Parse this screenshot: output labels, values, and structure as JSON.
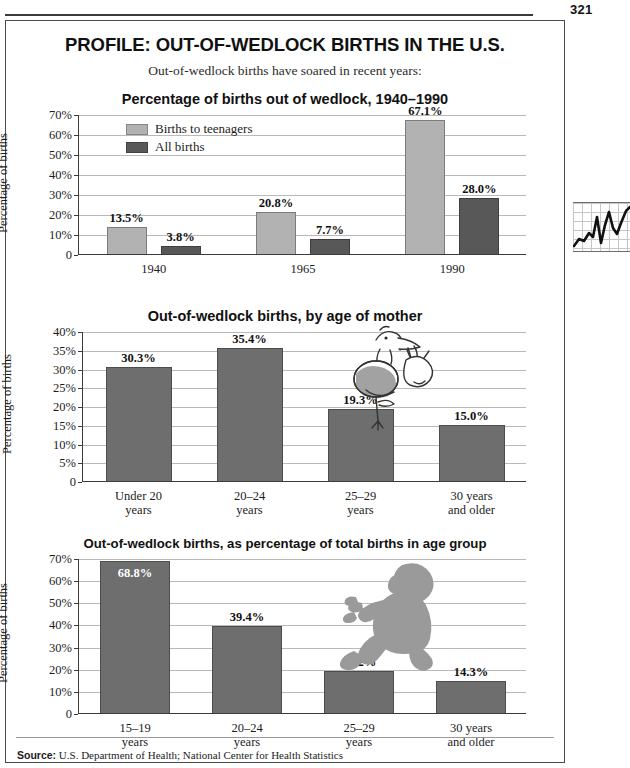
{
  "folio": "321",
  "header": {
    "title": "PROFILE: OUT-OF-WEDLOCK BIRTHS IN THE U.S.",
    "subtitle": "Out-of-wedlock births have soared in recent years:"
  },
  "colors": {
    "bar_light": "#b2b2b2",
    "bar_dark": "#585858",
    "bar_mid": "#6e6e6e",
    "axis": "#3c3c3c",
    "grid": "#b9b9b9"
  },
  "source": {
    "label": "Source:",
    "text": "U.S. Department of Health; National Center for Health Statistics"
  },
  "margin_art": {
    "name": "line-chart-doodle"
  },
  "illustrations": [
    {
      "name": "stork-carrying-bundle-illustration",
      "chart": 2
    },
    {
      "name": "crawling-baby-silhouette-illustration",
      "chart": 3
    }
  ],
  "chart_data": [
    {
      "type": "bar",
      "title": "Percentage of births out of wedlock, 1940–1990",
      "ylabel": "Percentage of births",
      "xlabel": "",
      "categories": [
        "1940",
        "1965",
        "1990"
      ],
      "ylim": [
        0,
        70
      ],
      "yticks": [
        "0",
        "10%",
        "20%",
        "30%",
        "40%",
        "50%",
        "60%",
        "70%"
      ],
      "ytick_values": [
        0,
        10,
        20,
        30,
        40,
        50,
        60,
        70
      ],
      "grid": true,
      "legend_position": "inside-top-left",
      "series": [
        {
          "name": "Births to teenagers",
          "color": "#b2b2b2",
          "values": [
            13.5,
            20.8,
            67.1
          ],
          "labels": [
            "13.5%",
            "20.8%",
            "67.1%"
          ]
        },
        {
          "name": "All births",
          "color": "#585858",
          "values": [
            3.8,
            7.7,
            28.0
          ],
          "labels": [
            "3.8%",
            "7.7%",
            "28.0%"
          ]
        }
      ]
    },
    {
      "type": "bar",
      "title": "Out-of-wedlock births, by age of mother",
      "ylabel": "Percentage of births",
      "xlabel": "",
      "categories": [
        "Under 20\nyears",
        "20–24\nyears",
        "25–29\nyears",
        "30 years\nand older"
      ],
      "ylim": [
        0,
        40
      ],
      "yticks": [
        "0",
        "5%",
        "10%",
        "15%",
        "20%",
        "25%",
        "30%",
        "35%",
        "40%"
      ],
      "ytick_values": [
        0,
        5,
        10,
        15,
        20,
        25,
        30,
        35,
        40
      ],
      "grid": true,
      "series": [
        {
          "name": "Out-of-wedlock births",
          "color": "#6e6e6e",
          "values": [
            30.3,
            35.4,
            19.3,
            15.0
          ],
          "labels": [
            "30.3%",
            "35.4%",
            "19.3%",
            "15.0%"
          ]
        }
      ]
    },
    {
      "type": "bar",
      "title": "Out-of-wedlock births, as percentage of total births in age group",
      "ylabel": "Percentage of births",
      "xlabel": "",
      "categories": [
        "15–19\nyears",
        "20–24\nyears",
        "25–29\nyears",
        "30 years\nand older"
      ],
      "ylim": [
        0,
        70
      ],
      "yticks": [
        "0",
        "10%",
        "20%",
        "30%",
        "40%",
        "50%",
        "60%",
        "70%"
      ],
      "ytick_values": [
        0,
        10,
        20,
        30,
        40,
        50,
        60,
        70
      ],
      "grid": true,
      "series": [
        {
          "name": "Out-of-wedlock births",
          "color": "#6e6e6e",
          "values": [
            68.8,
            39.4,
            19.2,
            14.3
          ],
          "labels": [
            "68.8%",
            "39.4%",
            "19.2%",
            "14.3%"
          ],
          "label_inside": [
            true,
            false,
            false,
            false
          ]
        }
      ]
    }
  ]
}
